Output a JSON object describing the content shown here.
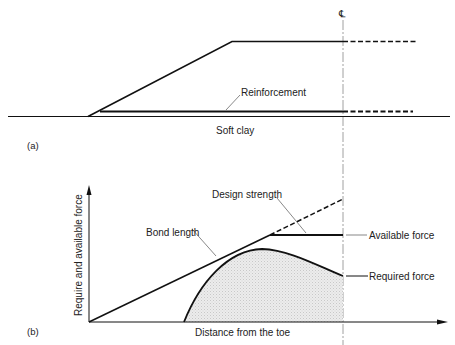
{
  "figure_a": {
    "panel_label": "(a)",
    "centerline_symbol": "℄",
    "reinforcement_label": "Reinforcement",
    "soil_label": "Soft clay"
  },
  "figure_b": {
    "panel_label": "(b)",
    "y_axis_label": "Require and available force",
    "x_axis_label": "Distance from the toe",
    "labels": {
      "design_strength": "Design strength",
      "bond_length": "Bond length",
      "available_force": "Available force",
      "required_force": "Required force"
    }
  },
  "colors": {
    "line": "#111111",
    "shade": "#e2e2e2",
    "text": "#222222"
  }
}
